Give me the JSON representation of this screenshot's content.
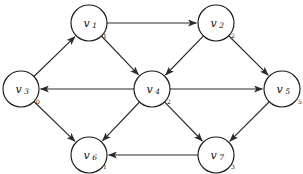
{
  "diagram": {
    "type": "directed-graph",
    "title": "",
    "background_color": "#ffffff",
    "stroke_color": "#2b2b2b",
    "node_fill_color": "#ffffff",
    "node_radius": 18,
    "nodes": [
      {
        "id": "v1",
        "label": "v",
        "subscript": "1",
        "weight": "1",
        "cx": 89,
        "cy": 23,
        "weight_dx": 16,
        "weight_dy": 13
      },
      {
        "id": "v2",
        "label": "v",
        "subscript": "2",
        "weight": "2",
        "cx": 216,
        "cy": 23,
        "weight_dx": 17,
        "weight_dy": 13
      },
      {
        "id": "v3",
        "label": "v",
        "subscript": "3",
        "weight": "0",
        "cx": 21,
        "cy": 89,
        "weight_dx": 17,
        "weight_dy": 13
      },
      {
        "id": "v4",
        "label": "v",
        "subscript": "4",
        "weight": "2",
        "cx": 152,
        "cy": 89,
        "weight_dx": 17,
        "weight_dy": 13
      },
      {
        "id": "v5",
        "label": "v",
        "subscript": "5",
        "weight": "5",
        "cx": 282,
        "cy": 89,
        "weight_dx": 18,
        "weight_dy": 13
      },
      {
        "id": "v6",
        "label": "v",
        "subscript": "6",
        "weight": "1",
        "cx": 89,
        "cy": 155,
        "weight_dx": 16,
        "weight_dy": 12
      },
      {
        "id": "v7",
        "label": "v",
        "subscript": "7",
        "weight": "3",
        "cx": 216,
        "cy": 155,
        "weight_dx": 17,
        "weight_dy": 12
      }
    ],
    "edges": [
      {
        "id": "e1",
        "from": "v1",
        "to": "v2",
        "directed": true
      },
      {
        "id": "e2",
        "from": "v3",
        "to": "v1",
        "directed": true
      },
      {
        "id": "e3",
        "from": "v1",
        "to": "v4",
        "directed": true
      },
      {
        "id": "e4",
        "from": "v2",
        "to": "v4",
        "directed": true
      },
      {
        "id": "e5",
        "from": "v2",
        "to": "v5",
        "directed": true
      },
      {
        "id": "e6",
        "from": "v4",
        "to": "v3",
        "directed": true
      },
      {
        "id": "e7",
        "from": "v4",
        "to": "v5",
        "directed": true
      },
      {
        "id": "e8",
        "from": "v3",
        "to": "v6",
        "directed": true
      },
      {
        "id": "e9",
        "from": "v4",
        "to": "v6",
        "directed": true
      },
      {
        "id": "e10",
        "from": "v4",
        "to": "v7",
        "directed": true
      },
      {
        "id": "e11",
        "from": "v5",
        "to": "v7",
        "directed": true
      },
      {
        "id": "e12",
        "from": "v7",
        "to": "v6",
        "directed": true
      }
    ]
  }
}
